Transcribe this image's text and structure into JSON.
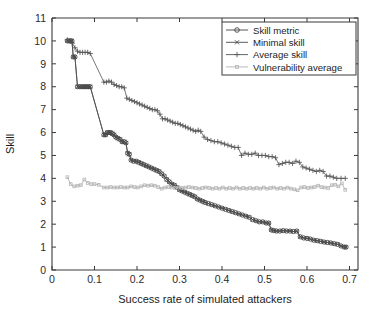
{
  "chart_data": {
    "type": "line",
    "title": "",
    "xlabel": "Success rate of simulated attackers",
    "ylabel": "Skill",
    "xlim": [
      0,
      0.72
    ],
    "ylim": [
      0,
      11
    ],
    "xticks": [
      0,
      0.1,
      0.2,
      0.3,
      0.4,
      0.5,
      0.6,
      0.7
    ],
    "xticklabels": [
      "0",
      "0.1",
      "0.2",
      "0.3",
      "0.4",
      "0.5",
      "0.6",
      "0.7"
    ],
    "yticks": [
      0,
      1,
      2,
      3,
      4,
      5,
      6,
      7,
      8,
      9,
      10,
      11
    ],
    "yticklabels": [
      "0",
      "1",
      "2",
      "3",
      "4",
      "5",
      "6",
      "7",
      "8",
      "9",
      "10",
      "11"
    ],
    "grid": false,
    "legend_position": "upper right",
    "series": [
      {
        "name": "Skill metric",
        "marker": "circle",
        "color": "#444444",
        "x": [
          0.036,
          0.04,
          0.044,
          0.047,
          0.05,
          0.054,
          0.06,
          0.065,
          0.07,
          0.074,
          0.078,
          0.082,
          0.086,
          0.09,
          0.122,
          0.126,
          0.13,
          0.134,
          0.138,
          0.142,
          0.146,
          0.15,
          0.155,
          0.16,
          0.165,
          0.17,
          0.174,
          0.178,
          0.182,
          0.186,
          0.192,
          0.198,
          0.204,
          0.21,
          0.216,
          0.222,
          0.228,
          0.234,
          0.24,
          0.246,
          0.252,
          0.258,
          0.264,
          0.27,
          0.276,
          0.282,
          0.288,
          0.294,
          0.3,
          0.306,
          0.312,
          0.318,
          0.324,
          0.33,
          0.336,
          0.342,
          0.348,
          0.354,
          0.36,
          0.368,
          0.376,
          0.384,
          0.392,
          0.4,
          0.408,
          0.416,
          0.424,
          0.432,
          0.44,
          0.448,
          0.456,
          0.464,
          0.472,
          0.48,
          0.488,
          0.496,
          0.504,
          0.51,
          0.516,
          0.522,
          0.528,
          0.536,
          0.544,
          0.552,
          0.56,
          0.568,
          0.576,
          0.584,
          0.592,
          0.6,
          0.608,
          0.616,
          0.624,
          0.632,
          0.64,
          0.648,
          0.656,
          0.664,
          0.672,
          0.68,
          0.688,
          0.692
        ],
        "y": [
          10.0,
          10.0,
          10.0,
          10.0,
          9.3,
          9.3,
          8.0,
          8.0,
          8.0,
          8.0,
          8.0,
          8.0,
          8.0,
          8.0,
          5.9,
          5.9,
          6.0,
          6.0,
          6.0,
          5.95,
          5.9,
          5.8,
          5.75,
          5.7,
          5.6,
          5.6,
          5.55,
          5.1,
          5.05,
          4.8,
          4.75,
          4.75,
          4.7,
          4.65,
          4.6,
          4.55,
          4.5,
          4.45,
          4.4,
          4.35,
          4.3,
          4.2,
          4.1,
          3.95,
          3.85,
          3.75,
          3.7,
          3.6,
          3.5,
          3.45,
          3.4,
          3.35,
          3.3,
          3.25,
          3.2,
          3.1,
          3.05,
          3.0,
          2.95,
          2.9,
          2.85,
          2.8,
          2.75,
          2.7,
          2.65,
          2.6,
          2.55,
          2.5,
          2.45,
          2.4,
          2.35,
          2.3,
          2.2,
          2.15,
          2.1,
          2.1,
          2.05,
          2.05,
          1.75,
          1.72,
          1.7,
          1.7,
          1.72,
          1.7,
          1.7,
          1.68,
          1.7,
          1.45,
          1.4,
          1.38,
          1.35,
          1.3,
          1.28,
          1.25,
          1.22,
          1.2,
          1.18,
          1.15,
          1.12,
          1.05,
          1.0,
          1.0
        ]
      },
      {
        "name": "Minimal skill",
        "marker": "x",
        "color": "#4a4a4a",
        "x": [
          0.036,
          0.04,
          0.044,
          0.047,
          0.05,
          0.054,
          0.06,
          0.065,
          0.07,
          0.074,
          0.078,
          0.082,
          0.086,
          0.09,
          0.122,
          0.126,
          0.13,
          0.134,
          0.138,
          0.142,
          0.146,
          0.15,
          0.155,
          0.16,
          0.165,
          0.17,
          0.174,
          0.178,
          0.182,
          0.186,
          0.192,
          0.198,
          0.204,
          0.21,
          0.216,
          0.222,
          0.228,
          0.234,
          0.24,
          0.246,
          0.252,
          0.258,
          0.264,
          0.27,
          0.276,
          0.282,
          0.288,
          0.294,
          0.3,
          0.306,
          0.312,
          0.318,
          0.324,
          0.33,
          0.336,
          0.342,
          0.348,
          0.354,
          0.36,
          0.368,
          0.376,
          0.384,
          0.392,
          0.4,
          0.408,
          0.416,
          0.424,
          0.432,
          0.44,
          0.448,
          0.456,
          0.464,
          0.472,
          0.48,
          0.488,
          0.496,
          0.504,
          0.51,
          0.516,
          0.522,
          0.528,
          0.536,
          0.544,
          0.552,
          0.56,
          0.568,
          0.576,
          0.584,
          0.592,
          0.6,
          0.608,
          0.616,
          0.624,
          0.632,
          0.64,
          0.648,
          0.656,
          0.664,
          0.672,
          0.68,
          0.688,
          0.692
        ],
        "y": [
          10.0,
          10.0,
          10.0,
          10.0,
          9.3,
          9.3,
          8.0,
          8.0,
          8.0,
          8.0,
          8.0,
          8.0,
          8.0,
          8.0,
          5.9,
          5.9,
          6.0,
          6.0,
          6.0,
          5.95,
          5.9,
          5.8,
          5.75,
          5.7,
          5.6,
          5.6,
          5.55,
          5.1,
          5.05,
          4.8,
          4.75,
          4.75,
          4.7,
          4.65,
          4.6,
          4.55,
          4.5,
          4.45,
          4.4,
          4.35,
          4.3,
          4.2,
          4.1,
          3.95,
          3.85,
          3.75,
          3.7,
          3.6,
          3.5,
          3.45,
          3.4,
          3.35,
          3.3,
          3.25,
          3.2,
          3.1,
          3.05,
          3.0,
          2.95,
          2.9,
          2.85,
          2.8,
          2.75,
          2.7,
          2.65,
          2.6,
          2.55,
          2.5,
          2.45,
          2.4,
          2.35,
          2.3,
          2.2,
          2.15,
          2.1,
          2.1,
          2.05,
          2.05,
          1.75,
          1.72,
          1.7,
          1.7,
          1.72,
          1.7,
          1.7,
          1.68,
          1.7,
          1.45,
          1.4,
          1.38,
          1.35,
          1.3,
          1.28,
          1.25,
          1.22,
          1.2,
          1.18,
          1.15,
          1.12,
          1.05,
          1.0,
          1.0
        ]
      },
      {
        "name": "Average skill",
        "marker": "plus",
        "color": "#555555",
        "x": [
          0.036,
          0.042,
          0.048,
          0.054,
          0.06,
          0.066,
          0.072,
          0.078,
          0.084,
          0.09,
          0.122,
          0.128,
          0.134,
          0.14,
          0.146,
          0.152,
          0.158,
          0.164,
          0.17,
          0.176,
          0.182,
          0.188,
          0.194,
          0.2,
          0.206,
          0.212,
          0.218,
          0.224,
          0.23,
          0.236,
          0.242,
          0.248,
          0.254,
          0.26,
          0.266,
          0.272,
          0.278,
          0.284,
          0.29,
          0.296,
          0.302,
          0.308,
          0.314,
          0.32,
          0.326,
          0.332,
          0.338,
          0.344,
          0.35,
          0.358,
          0.366,
          0.374,
          0.382,
          0.39,
          0.398,
          0.406,
          0.414,
          0.422,
          0.43,
          0.438,
          0.446,
          0.454,
          0.462,
          0.47,
          0.478,
          0.486,
          0.494,
          0.502,
          0.51,
          0.518,
          0.526,
          0.534,
          0.542,
          0.55,
          0.558,
          0.566,
          0.574,
          0.582,
          0.59,
          0.598,
          0.606,
          0.614,
          0.622,
          0.63,
          0.638,
          0.646,
          0.654,
          0.662,
          0.67,
          0.68,
          0.69
        ],
        "y": [
          10.05,
          10.0,
          9.9,
          9.7,
          9.55,
          9.5,
          9.5,
          9.5,
          9.5,
          9.45,
          8.2,
          8.2,
          8.25,
          8.2,
          8.1,
          8.05,
          8.0,
          8.0,
          7.95,
          7.5,
          7.45,
          7.4,
          7.35,
          7.3,
          7.25,
          7.2,
          7.15,
          7.1,
          7.05,
          7.0,
          7.0,
          6.95,
          6.8,
          6.6,
          6.6,
          6.55,
          6.5,
          6.45,
          6.4,
          6.4,
          6.35,
          6.3,
          6.25,
          6.2,
          6.15,
          6.1,
          6.05,
          6.1,
          6.05,
          5.8,
          5.7,
          5.65,
          5.6,
          5.6,
          5.55,
          5.5,
          5.45,
          5.4,
          5.35,
          5.35,
          5.0,
          5.1,
          5.05,
          5.05,
          5.1,
          5.0,
          5.0,
          5.0,
          4.95,
          4.95,
          4.9,
          4.6,
          4.65,
          4.7,
          4.7,
          4.65,
          4.75,
          4.7,
          4.5,
          4.45,
          4.4,
          4.35,
          4.3,
          4.35,
          4.3,
          4.1,
          4.1,
          4.05,
          4.0,
          4.0,
          4.0
        ]
      },
      {
        "name": "Vulnerability average",
        "marker": "square",
        "color": "#b4b4b4",
        "x": [
          0.036,
          0.044,
          0.052,
          0.06,
          0.068,
          0.076,
          0.084,
          0.092,
          0.1,
          0.11,
          0.122,
          0.13,
          0.138,
          0.146,
          0.154,
          0.162,
          0.17,
          0.178,
          0.186,
          0.194,
          0.202,
          0.21,
          0.218,
          0.226,
          0.234,
          0.242,
          0.25,
          0.258,
          0.266,
          0.274,
          0.282,
          0.29,
          0.298,
          0.306,
          0.314,
          0.322,
          0.33,
          0.338,
          0.346,
          0.354,
          0.362,
          0.37,
          0.378,
          0.386,
          0.394,
          0.402,
          0.41,
          0.418,
          0.426,
          0.434,
          0.442,
          0.45,
          0.458,
          0.466,
          0.474,
          0.482,
          0.49,
          0.498,
          0.506,
          0.514,
          0.522,
          0.53,
          0.538,
          0.546,
          0.554,
          0.562,
          0.57,
          0.578,
          0.586,
          0.594,
          0.602,
          0.61,
          0.618,
          0.626,
          0.634,
          0.642,
          0.65,
          0.658,
          0.666,
          0.674,
          0.682,
          0.69
        ],
        "y": [
          4.05,
          3.75,
          3.65,
          3.68,
          3.7,
          3.95,
          3.8,
          3.75,
          3.75,
          3.72,
          3.6,
          3.6,
          3.62,
          3.6,
          3.6,
          3.62,
          3.6,
          3.6,
          3.65,
          3.62,
          3.6,
          3.65,
          3.7,
          3.68,
          3.7,
          3.68,
          3.62,
          3.55,
          3.6,
          3.62,
          3.6,
          3.58,
          3.6,
          3.58,
          3.6,
          3.62,
          3.6,
          3.58,
          3.55,
          3.58,
          3.6,
          3.58,
          3.55,
          3.58,
          3.55,
          3.6,
          3.55,
          3.58,
          3.55,
          3.6,
          3.55,
          3.58,
          3.55,
          3.58,
          3.55,
          3.58,
          3.55,
          3.6,
          3.55,
          3.58,
          3.6,
          3.55,
          3.58,
          3.55,
          3.6,
          3.55,
          3.52,
          3.48,
          3.6,
          3.62,
          3.58,
          3.6,
          3.62,
          3.68,
          3.62,
          3.6,
          3.58,
          3.7,
          3.72,
          3.65,
          3.78,
          3.5
        ]
      }
    ]
  },
  "legend": {
    "entries": [
      {
        "label": "Skill metric"
      },
      {
        "label": "Minimal skill"
      },
      {
        "label": "Average skill"
      },
      {
        "label": "Vulnerability average"
      }
    ]
  }
}
